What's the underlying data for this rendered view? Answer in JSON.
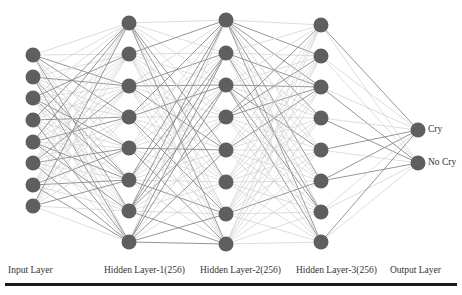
{
  "diagram": {
    "type": "neural-network",
    "colors": {
      "node": "#5f5f5f",
      "edge_dark": "#8a8a8a",
      "edge_light": "#cfcfcf",
      "rule": "#1a1a1a",
      "text": "#333333"
    },
    "layers": [
      {
        "id": "input",
        "label": "Input Layer",
        "x": 33,
        "label_x": 8,
        "nodes": [
          55,
          77,
          98,
          120,
          142,
          163,
          185,
          206
        ]
      },
      {
        "id": "hidden1",
        "label": "Hidden Layer-1(256)",
        "x": 129,
        "label_x": 104,
        "nodes": [
          23,
          54,
          86,
          117,
          148,
          180,
          211,
          242
        ]
      },
      {
        "id": "hidden2",
        "label": "Hidden Layer-2(256)",
        "x": 226,
        "label_x": 200,
        "nodes": [
          20,
          53,
          85,
          117,
          150,
          182,
          214,
          244
        ]
      },
      {
        "id": "hidden3",
        "label": "Hidden Layer-3(256)",
        "x": 321,
        "label_x": 296,
        "nodes": [
          25,
          56,
          87,
          118,
          150,
          181,
          212,
          242
        ]
      },
      {
        "id": "output",
        "label": "Output Layer",
        "x": 418,
        "label_x": 390,
        "nodes": [
          130,
          163
        ]
      }
    ],
    "output_labels": [
      "Cry",
      "No Cry"
    ],
    "node_radius": 7.5
  }
}
